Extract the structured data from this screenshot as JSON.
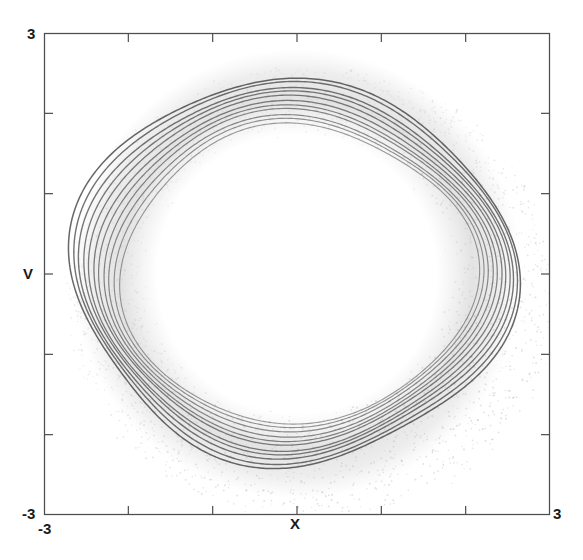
{
  "figure": {
    "width": 583,
    "height": 560,
    "background": "#ffffff"
  },
  "axes": {
    "frame": {
      "left": 44,
      "top": 33,
      "right": 550,
      "bottom": 515
    },
    "frame_color": "#4d4d4d",
    "xaxis": {
      "title": "X",
      "min_label": "-3",
      "max_label": "3",
      "range": [
        -3,
        3
      ],
      "tick_values": [
        -2,
        -1,
        0,
        1,
        2
      ]
    },
    "yaxis": {
      "title": "V",
      "min_label": "-3",
      "max_label": "3",
      "range": [
        -3,
        3
      ],
      "tick_values": [
        -2,
        -1,
        0,
        1,
        2
      ]
    }
  },
  "chart_data": {
    "type": "line",
    "title": "",
    "xlabel": "X",
    "ylabel": "V",
    "xlim": [
      -3,
      3
    ],
    "ylim": [
      -3,
      3
    ],
    "xtick_labels": [
      "-3",
      "3"
    ],
    "ytick_labels": [
      "-3",
      "3"
    ],
    "grid": false,
    "legend": "none",
    "trajectory_color": "#3c3c3c",
    "scatter_color": "#b4b4b4",
    "orbit_count": 11,
    "orbits": [
      {
        "index": 1,
        "radius": 2.52,
        "center": [
          -0.06,
          0.04
        ],
        "squash": 0.97,
        "squareness": 0.3,
        "rotation_deg": -12,
        "opacity": 0.78,
        "width": 1.5
      },
      {
        "index": 2,
        "radius": 2.47,
        "center": [
          -0.05,
          0.04
        ],
        "squash": 0.97,
        "squareness": 0.29,
        "rotation_deg": -10,
        "opacity": 0.72,
        "width": 1.4
      },
      {
        "index": 3,
        "radius": 2.42,
        "center": [
          -0.05,
          0.03
        ],
        "squash": 0.96,
        "squareness": 0.28,
        "rotation_deg": -8,
        "opacity": 0.7,
        "width": 1.4
      },
      {
        "index": 4,
        "radius": 2.37,
        "center": [
          -0.04,
          0.03
        ],
        "squash": 0.96,
        "squareness": 0.27,
        "rotation_deg": -6,
        "opacity": 0.68,
        "width": 1.3
      },
      {
        "index": 5,
        "radius": 2.32,
        "center": [
          -0.04,
          0.02
        ],
        "squash": 0.96,
        "squareness": 0.26,
        "rotation_deg": -4,
        "opacity": 0.66,
        "width": 1.3
      },
      {
        "index": 6,
        "radius": 2.27,
        "center": [
          -0.03,
          0.02
        ],
        "squash": 0.95,
        "squareness": 0.25,
        "rotation_deg": -2,
        "opacity": 0.64,
        "width": 1.3
      },
      {
        "index": 7,
        "radius": 2.22,
        "center": [
          -0.03,
          0.01
        ],
        "squash": 0.95,
        "squareness": 0.24,
        "rotation_deg": 0,
        "opacity": 0.62,
        "width": 1.2
      },
      {
        "index": 8,
        "radius": 2.17,
        "center": [
          -0.02,
          0.01
        ],
        "squash": 0.95,
        "squareness": 0.23,
        "rotation_deg": 2,
        "opacity": 0.6,
        "width": 1.2
      },
      {
        "index": 9,
        "radius": 2.12,
        "center": [
          -0.02,
          0.0
        ],
        "squash": 0.94,
        "squareness": 0.22,
        "rotation_deg": 4,
        "opacity": 0.58,
        "width": 1.2
      },
      {
        "index": 10,
        "radius": 2.07,
        "center": [
          -0.01,
          0.0
        ],
        "squash": 0.94,
        "squareness": 0.21,
        "rotation_deg": 6,
        "opacity": 0.55,
        "width": 1.1
      },
      {
        "index": 11,
        "radius": 2.02,
        "center": [
          0.0,
          -0.01
        ],
        "squash": 0.94,
        "squareness": 0.2,
        "rotation_deg": 8,
        "opacity": 0.5,
        "width": 1.1
      }
    ],
    "scatter_cloud": {
      "point_count": 2600,
      "inner_radius": 1.85,
      "outer_radius": 3.05,
      "center": [
        0.0,
        0.0
      ],
      "density_bias_angle_deg": -55,
      "opacity": 0.3
    }
  }
}
